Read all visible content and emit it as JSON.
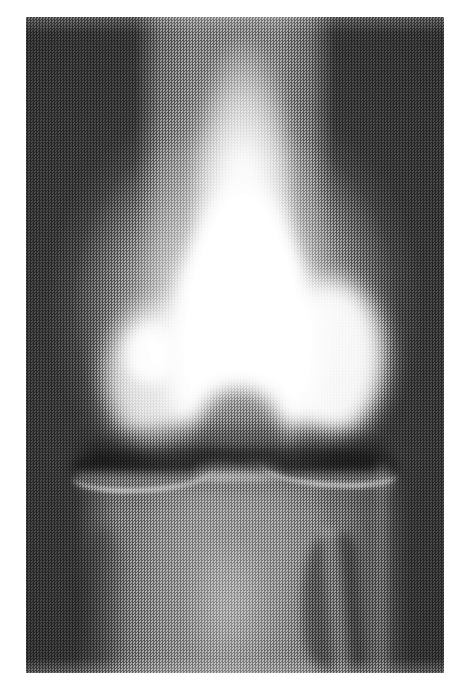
{
  "page": {
    "width": 468,
    "height": 687,
    "background_color": "#ffffff",
    "type": "medical-radiograph",
    "modality": "X-ray (plain radiograph)",
    "body_part": "Knee",
    "projection": "AP (anteroposterior) weight-bearing",
    "laterality_visible": false,
    "has_text_annotations": false,
    "has_markers": false,
    "caption": ""
  },
  "plate": {
    "left": 26,
    "top": 17,
    "width": 418,
    "height": 656,
    "background_color": "#3b3b3b",
    "film_fog_color": "#3b3b3b",
    "bone_color": "#ffffff",
    "soft_tissue_color": "#8a8a8a",
    "print_texture": "halftone-dither",
    "border_style": "none"
  },
  "anatomy": {
    "structures": [
      {
        "name": "femoral-shaft",
        "label": "Distal femoral shaft",
        "region": "superior-center",
        "brightness": "very-bright"
      },
      {
        "name": "medial-femoral-condyle",
        "label": "Medial femoral condyle",
        "region": "mid-left",
        "brightness": "bright"
      },
      {
        "name": "lateral-femoral-condyle",
        "label": "Lateral femoral condyle",
        "region": "mid-right",
        "brightness": "very-bright"
      },
      {
        "name": "patella",
        "label": "Patella (superimposed)",
        "region": "center",
        "brightness": "very-bright"
      },
      {
        "name": "intercondylar-notch",
        "label": "Intercondylar notch",
        "region": "center-low",
        "brightness": "dark"
      },
      {
        "name": "joint-space",
        "label": "Tibiofemoral joint space",
        "region": "center-horizontal-band",
        "brightness": "lucent"
      },
      {
        "name": "tibial-plateau",
        "label": "Tibial plateau",
        "region": "below-joint-space",
        "brightness": "bright-cortical-line"
      },
      {
        "name": "tibial-spines",
        "label": "Tibial intercondylar eminence",
        "region": "center",
        "brightness": "bright"
      },
      {
        "name": "proximal-tibia",
        "label": "Proximal tibia",
        "region": "inferior-center",
        "brightness": "mid-gray"
      },
      {
        "name": "fibular-head",
        "label": "Fibular head",
        "region": "inferior-right",
        "brightness": "dark-overlap"
      },
      {
        "name": "soft-tissue-envelope",
        "label": "Soft tissue envelope",
        "region": "full-column",
        "brightness": "gray"
      }
    ]
  },
  "colors": {
    "page_background": "#ffffff",
    "film_background": "#3b3b3b",
    "bone_highlight": "#ffffff",
    "soft_tissue": "#8a8a8a",
    "lucent_joint": "#4d4d4d"
  }
}
